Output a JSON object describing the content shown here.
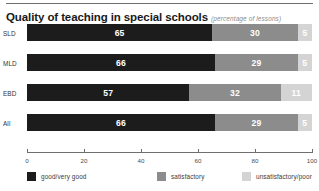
{
  "header": {
    "title": "Quality of teaching in special schools",
    "subtitle": "(percentage of lessons)"
  },
  "chart_data": {
    "type": "bar",
    "orientation": "horizontal",
    "stacked": true,
    "normalized_percent": true,
    "title": "Quality of teaching in special schools",
    "subtitle": "(percentage of lessons)",
    "xlabel": "",
    "ylabel": "",
    "xlim": [
      0,
      100
    ],
    "xticks": [
      0,
      20,
      40,
      60,
      80,
      100
    ],
    "tick_labels": [
      "0",
      "20",
      "40",
      "60",
      "80",
      "100"
    ],
    "grid": false,
    "legend_position": "bottom",
    "categories": [
      "SLD",
      "MLD",
      "EBD",
      "All"
    ],
    "series": [
      {
        "name": "good/very good",
        "color": "#1c1c1c",
        "values": [
          65,
          66,
          57,
          66
        ]
      },
      {
        "name": "satisfactory",
        "color": "#8c8c8c",
        "values": [
          30,
          29,
          32,
          29
        ]
      },
      {
        "name": "unsatisfactory/poor",
        "color": "#d4d4d4",
        "values": [
          5,
          5,
          11,
          5
        ]
      }
    ],
    "rows": [
      {
        "label": "SLD",
        "segments": [
          {
            "series": "good/very good",
            "value": 65,
            "label": "65"
          },
          {
            "series": "satisfactory",
            "value": 30,
            "label": "30"
          },
          {
            "series": "unsatisfactory/poor",
            "value": 5,
            "label": "5"
          }
        ]
      },
      {
        "label": "MLD",
        "segments": [
          {
            "series": "good/very good",
            "value": 66,
            "label": "66"
          },
          {
            "series": "satisfactory",
            "value": 29,
            "label": "29"
          },
          {
            "series": "unsatisfactory/poor",
            "value": 5,
            "label": "5"
          }
        ]
      },
      {
        "label": "EBD",
        "segments": [
          {
            "series": "good/very good",
            "value": 57,
            "label": "57"
          },
          {
            "series": "satisfactory",
            "value": 32,
            "label": "32"
          },
          {
            "series": "unsatisfactory/poor",
            "value": 11,
            "label": "11"
          }
        ]
      },
      {
        "label": "All",
        "segments": [
          {
            "series": "good/very good",
            "value": 66,
            "label": "66"
          },
          {
            "series": "satisfactory",
            "value": 29,
            "label": "29"
          },
          {
            "series": "unsatisfactory/poor",
            "value": 5,
            "label": "5"
          }
        ]
      }
    ]
  },
  "legend": [
    {
      "label": "good/very good",
      "color": "#1c1c1c"
    },
    {
      "label": "satisfactory",
      "color": "#8c8c8c"
    },
    {
      "label": "unsatisfactory/poor",
      "color": "#d4d4d4"
    }
  ]
}
